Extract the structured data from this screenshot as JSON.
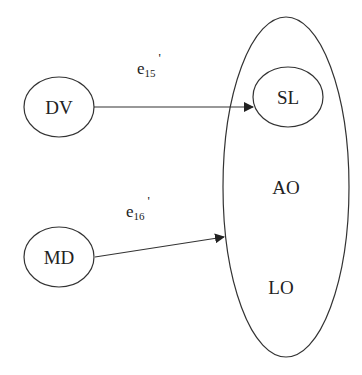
{
  "diagram": {
    "type": "path-diagram",
    "colors": {
      "stroke": "#333333",
      "text": "#222222",
      "background": "#ffffff"
    },
    "nodes": {
      "dv": {
        "label": "DV"
      },
      "md": {
        "label": "MD"
      },
      "sl": {
        "label": "SL"
      },
      "ao": {
        "label": "AO"
      },
      "lo": {
        "label": "LO"
      }
    },
    "group": {
      "members": [
        "SL",
        "AO",
        "LO"
      ]
    },
    "edges": [
      {
        "from": "DV",
        "to": "SL",
        "label_base": "e",
        "label_sub": "15",
        "label_prime": "'"
      },
      {
        "from": "MD",
        "to": "group",
        "label_base": "e",
        "label_sub": "16",
        "label_prime": "'"
      }
    ]
  }
}
